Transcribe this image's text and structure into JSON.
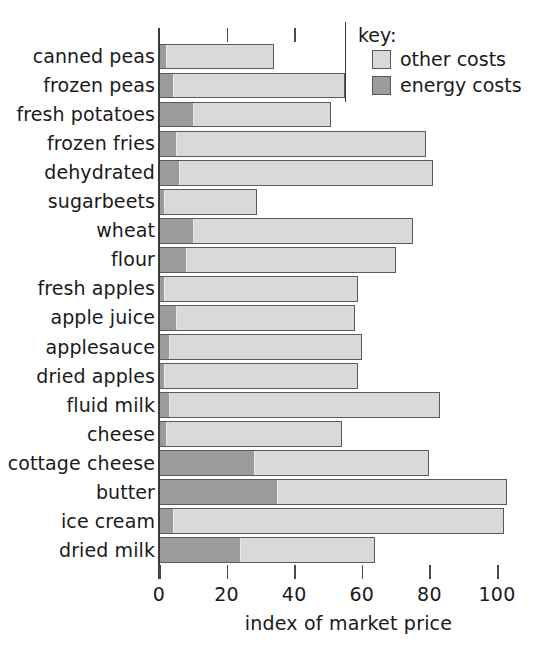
{
  "chart_data": {
    "type": "bar",
    "orientation": "horizontal",
    "stacked": true,
    "title": "",
    "subtitle": "",
    "xlabel": "index of market price",
    "ylabel": "",
    "xlim": [
      0,
      104
    ],
    "xticks": [
      0,
      20,
      40,
      60,
      80,
      100
    ],
    "xtick_labels": [
      "0",
      "20",
      "40",
      "60",
      "80",
      "100"
    ],
    "grid": false,
    "legend_position": "top-right",
    "legend_title": "key:",
    "categories": [
      "canned peas",
      "frozen peas",
      "fresh potatoes",
      "frozen fries",
      "dehydrated",
      "sugarbeets",
      "wheat",
      "flour",
      "fresh apples",
      "apple juice",
      "applesauce",
      "dried apples",
      "fluid milk",
      "cheese",
      "cottage cheese",
      "butter",
      "ice cream",
      "dried milk"
    ],
    "series": [
      {
        "name": "energy costs",
        "color": "#9b9b9b",
        "values": [
          2,
          4,
          10,
          5,
          6,
          1.5,
          10,
          8,
          1.5,
          5,
          3,
          1.5,
          3,
          2,
          28,
          35,
          4,
          24
        ]
      },
      {
        "name": "other costs",
        "color": "#d9d9d9",
        "values": [
          32,
          51,
          41,
          74,
          75,
          27.5,
          65,
          62,
          57.5,
          53,
          57,
          57.5,
          80,
          52,
          52,
          68,
          98,
          40
        ]
      }
    ],
    "totals": [
      34,
      55,
      51,
      79,
      81,
      29,
      75,
      70,
      59,
      58,
      60,
      59,
      83,
      54,
      80,
      103,
      102,
      64
    ]
  },
  "legend": {
    "title": "key:",
    "items": [
      {
        "label": "other costs",
        "color": "#d9d9d9"
      },
      {
        "label": "energy costs",
        "color": "#9b9b9b"
      }
    ]
  },
  "axis": {
    "xlabel": "index of market price",
    "ticks": [
      "0",
      "20",
      "40",
      "60",
      "80",
      "100"
    ]
  }
}
